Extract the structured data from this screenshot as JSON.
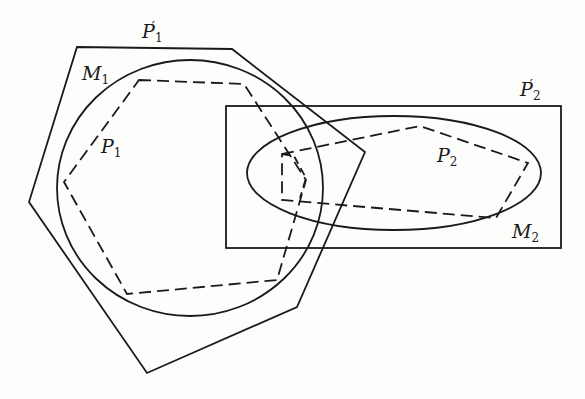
{
  "diagram": {
    "stroke_color": "#1a1a1a",
    "background": "#fdfdfc",
    "shapes": {
      "P1_prime": {
        "kind": "polygon",
        "style": "solid",
        "points": "77,47 232,49 365,152 297,307 147,373 29,202"
      },
      "M1": {
        "kind": "ellipse",
        "style": "solid",
        "cx": 190,
        "cy": 188,
        "rx": 133,
        "ry": 128
      },
      "P1": {
        "kind": "polygon",
        "style": "dashed",
        "points": "139,80 244,84 306,180 277,280 127,294 64,182"
      },
      "P2_prime": {
        "kind": "rect",
        "style": "solid",
        "x": 226,
        "y": 106,
        "width": 335,
        "height": 142
      },
      "M2": {
        "kind": "ellipse",
        "style": "solid",
        "cx": 394,
        "cy": 173,
        "rx": 147,
        "ry": 57
      },
      "P2": {
        "kind": "polygon",
        "style": "dashed",
        "points": "282,154 420,126 528,163 496,218 282,200"
      }
    },
    "labels": {
      "P1_prime": {
        "base": "P",
        "sub": "1",
        "prime": "′"
      },
      "M1": {
        "base": "M",
        "sub": "1"
      },
      "P1": {
        "base": "P",
        "sub": "1"
      },
      "P2_prime": {
        "base": "P",
        "sub": "2",
        "prime": "′"
      },
      "P2": {
        "base": "P",
        "sub": "2"
      },
      "M2": {
        "base": "M",
        "sub": "2"
      }
    }
  }
}
